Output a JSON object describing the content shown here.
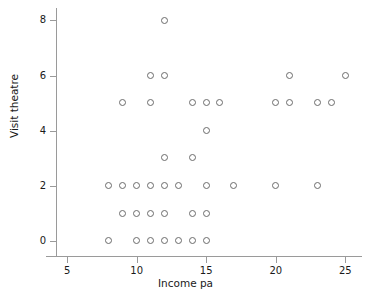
{
  "chart_data": {
    "type": "scatter",
    "title": "",
    "xlabel": "Income pa",
    "ylabel": "Visit theatre",
    "xlim": [
      4.2,
      26.2
    ],
    "ylim": [
      -0.55,
      8.45
    ],
    "xticks": [
      5,
      10,
      15,
      20,
      25
    ],
    "yticks": [
      0,
      2,
      4,
      6,
      8
    ],
    "xticklabels": [
      "5",
      "10",
      "15",
      "20",
      "25"
    ],
    "yticklabels": [
      "0",
      "2",
      "4",
      "6",
      "8"
    ],
    "grid": false,
    "legend": false,
    "marker": "open-circle",
    "marker_color": "#6b6b6b",
    "axis_color": "#9a9a9a",
    "points": [
      {
        "x": 8,
        "y": 0
      },
      {
        "x": 10,
        "y": 0
      },
      {
        "x": 11,
        "y": 0
      },
      {
        "x": 12,
        "y": 0
      },
      {
        "x": 13,
        "y": 0
      },
      {
        "x": 14,
        "y": 0
      },
      {
        "x": 15,
        "y": 0
      },
      {
        "x": 9,
        "y": 1
      },
      {
        "x": 10,
        "y": 1
      },
      {
        "x": 11,
        "y": 1
      },
      {
        "x": 12,
        "y": 1
      },
      {
        "x": 14,
        "y": 1
      },
      {
        "x": 15,
        "y": 1
      },
      {
        "x": 8,
        "y": 2
      },
      {
        "x": 9,
        "y": 2
      },
      {
        "x": 10,
        "y": 2
      },
      {
        "x": 11,
        "y": 2
      },
      {
        "x": 12,
        "y": 2
      },
      {
        "x": 13,
        "y": 2
      },
      {
        "x": 15,
        "y": 2
      },
      {
        "x": 17,
        "y": 2
      },
      {
        "x": 20,
        "y": 2
      },
      {
        "x": 23,
        "y": 2
      },
      {
        "x": 12,
        "y": 3
      },
      {
        "x": 14,
        "y": 3
      },
      {
        "x": 15,
        "y": 4
      },
      {
        "x": 9,
        "y": 5
      },
      {
        "x": 11,
        "y": 5
      },
      {
        "x": 14,
        "y": 5
      },
      {
        "x": 15,
        "y": 5
      },
      {
        "x": 16,
        "y": 5
      },
      {
        "x": 20,
        "y": 5
      },
      {
        "x": 21,
        "y": 5
      },
      {
        "x": 23,
        "y": 5
      },
      {
        "x": 24,
        "y": 5
      },
      {
        "x": 11,
        "y": 6
      },
      {
        "x": 12,
        "y": 6
      },
      {
        "x": 21,
        "y": 6
      },
      {
        "x": 25,
        "y": 6
      },
      {
        "x": 12,
        "y": 8
      }
    ]
  }
}
